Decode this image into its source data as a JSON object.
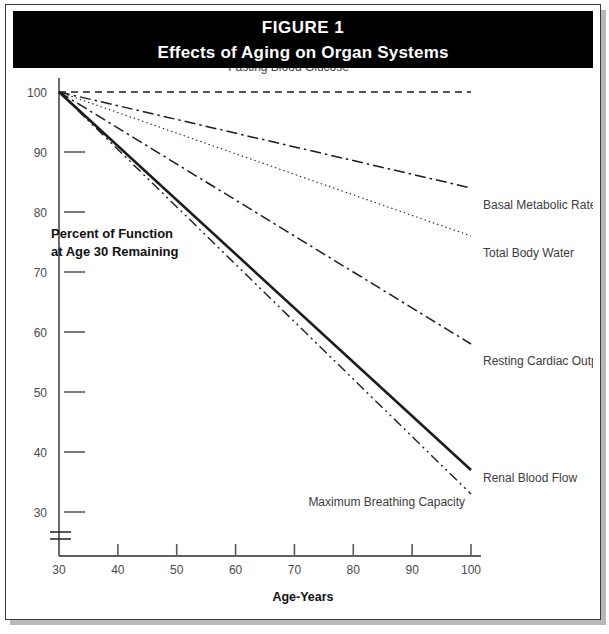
{
  "figure": {
    "number_label": "FIGURE 1",
    "title": "Effects of Aging on Organ Systems"
  },
  "chart_data": {
    "type": "line",
    "title": "Effects of Aging on Organ Systems",
    "xlabel": "Age-Years",
    "ylabel": "Percent of Function at Age 30 Remaining",
    "ylabel_line1": "Percent of Function",
    "ylabel_line2": "at Age 30 Remaining",
    "x": [
      30,
      100
    ],
    "xlim": [
      30,
      100
    ],
    "ylim": [
      30,
      100
    ],
    "xticks": [
      30,
      40,
      50,
      60,
      70,
      80,
      90,
      100
    ],
    "xtick_labels": [
      "30",
      "40",
      "50",
      "60",
      "70",
      "80",
      "90",
      "100"
    ],
    "yticks": [
      30,
      40,
      50,
      60,
      70,
      80,
      90,
      100
    ],
    "ytick_labels": [
      "30",
      "40",
      "50",
      "60",
      "70",
      "80",
      "90",
      "100"
    ],
    "grid": false,
    "legend": "inline-right-labels",
    "axis_break": true,
    "axis_break_note": "y-axis broken below 30",
    "series": [
      {
        "name": "Fasting Blood Glucose",
        "values": [
          100,
          100
        ],
        "style": "dashed",
        "label_x": 69,
        "label_value": 103.5,
        "label_anchor": "middle",
        "leader": false
      },
      {
        "name": "Basal Metabolic Rate",
        "values": [
          100,
          84
        ],
        "style": "dash-dot",
        "label_x": 101,
        "label_value": 80.5,
        "label_anchor": "start",
        "leader": false
      },
      {
        "name": "Total Body Water",
        "values": [
          100,
          76
        ],
        "style": "dotted",
        "label_x": 101,
        "label_value": 72.5,
        "label_anchor": "start",
        "leader": false
      },
      {
        "name": "Resting Cardiac Output",
        "values": [
          100,
          58
        ],
        "style": "dash-dot",
        "label_x": 101,
        "label_value": 54.5,
        "label_anchor": "start",
        "leader": false
      },
      {
        "name": "Renal Blood Flow",
        "values": [
          100,
          37
        ],
        "style": "solid",
        "label_x": 101,
        "label_value": 35.0,
        "label_anchor": "start",
        "leader": false
      },
      {
        "name": "Maximum Breathing Capacity",
        "values": [
          100,
          33
        ],
        "style": "dash-dot-dot",
        "label_x": 99,
        "label_value": 31.0,
        "label_anchor": "end",
        "leader": false
      }
    ]
  },
  "colors": {
    "header_background": "#000000",
    "header_text": "#ffffff",
    "plot_background": "#ffffff",
    "line": "#1c1c1c",
    "tick_text": "#4a4a4a",
    "frame": "#3a3a3a"
  }
}
